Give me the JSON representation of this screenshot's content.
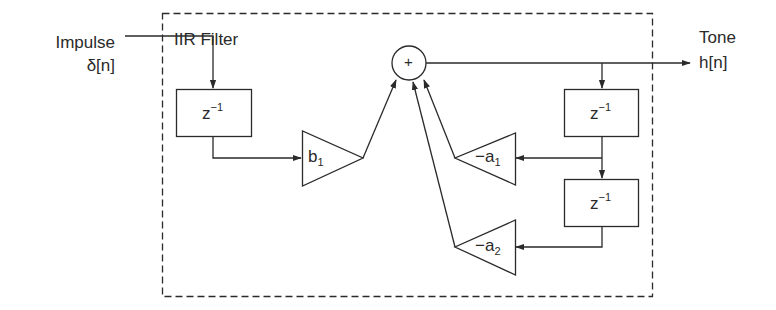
{
  "diagram": {
    "type": "IIR filter block diagram",
    "container": {
      "title": "IIR Filter",
      "border_style": "dashed"
    },
    "input": {
      "name": "Impulse",
      "signal": "δ[n]"
    },
    "output": {
      "name": "Tone",
      "signal": "h[n]"
    },
    "summer": {
      "symbol": "+"
    },
    "delays": [
      {
        "id": "delay-input",
        "label_base": "z",
        "label_exp": "−1"
      },
      {
        "id": "delay-output-1",
        "label_base": "z",
        "label_exp": "−1"
      },
      {
        "id": "delay-output-2",
        "label_base": "z",
        "label_exp": "−1"
      }
    ],
    "gains": [
      {
        "id": "gain-b1",
        "label_base": "b",
        "label_sub": "1"
      },
      {
        "id": "gain-a1",
        "label_base": "−a",
        "label_sub": "1"
      },
      {
        "id": "gain-a2",
        "label_base": "−a",
        "label_sub": "2"
      }
    ],
    "colors": {
      "stroke": "#2a2a2a",
      "background": "#ffffff"
    }
  }
}
